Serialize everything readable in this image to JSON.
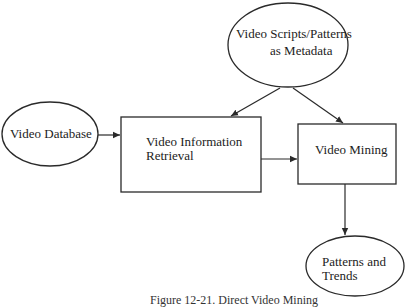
{
  "diagram": {
    "title_caption": "Figure 12-21. Direct Video Mining",
    "nodes": {
      "metadata": {
        "shape": "ellipse",
        "line1": "Video Scripts/Patterns",
        "line2": "as Metadata"
      },
      "database": {
        "shape": "ellipse",
        "label": "Video Database"
      },
      "retrieval": {
        "shape": "rectangle",
        "line1": "Video Information",
        "line2": "Retrieval"
      },
      "mining": {
        "shape": "rectangle",
        "label": "Video Mining"
      },
      "patterns": {
        "shape": "ellipse",
        "line1": "Patterns and",
        "line2": "Trends"
      }
    },
    "edges": [
      {
        "from": "Video Database",
        "to": "Video Information Retrieval"
      },
      {
        "from": "Video Scripts/Patterns as Metadata",
        "to": "Video Information Retrieval"
      },
      {
        "from": "Video Scripts/Patterns as Metadata",
        "to": "Video Mining"
      },
      {
        "from": "Video Information Retrieval",
        "to": "Video Mining"
      },
      {
        "from": "Video Mining",
        "to": "Patterns and Trends"
      }
    ],
    "colors": {
      "stroke": "#2a2a2a",
      "background": "#ffffff"
    }
  }
}
